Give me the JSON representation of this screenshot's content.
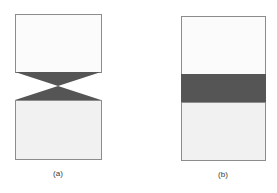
{
  "colors": {
    "background": "#ffffff",
    "box_fill_upper": "#fbfbfb",
    "box_fill_lower": "#f1f1f1",
    "box_stroke": "#8c8c8c",
    "dark_region": "#555555"
  },
  "panels": [
    {
      "id": "a",
      "label": "(a)",
      "shape": "two boxes joined by an hourglass (bow-tie) shaped dark region",
      "upper_box": {
        "x": 15,
        "y": 14,
        "w": 86,
        "h": 58
      },
      "junction": {
        "type": "hourglass",
        "top_y": 72,
        "pinch_y": 86,
        "bottom_y": 100
      },
      "lower_box": {
        "x": 15,
        "y": 100,
        "w": 86,
        "h": 59
      }
    },
    {
      "id": "b",
      "label": "(b)",
      "shape": "two boxes joined by a uniform dark rectangular band",
      "upper_box": {
        "x": 181,
        "y": 16,
        "w": 84,
        "h": 58
      },
      "junction": {
        "type": "band",
        "top_y": 74,
        "bottom_y": 102
      },
      "lower_box": {
        "x": 181,
        "y": 102,
        "w": 84,
        "h": 58
      }
    }
  ]
}
